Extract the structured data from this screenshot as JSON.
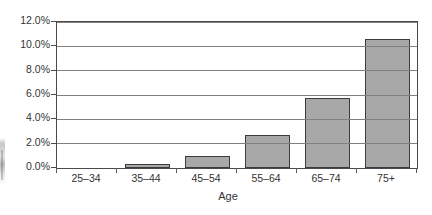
{
  "chart_data": {
    "type": "bar",
    "title": "",
    "xlabel": "Age",
    "ylabel": "",
    "categories": [
      "25–34",
      "35–44",
      "45–54",
      "55–64",
      "65–74",
      "75+"
    ],
    "values": [
      0.0,
      0.3,
      1.0,
      2.7,
      5.75,
      10.6
    ],
    "ylim": [
      0.0,
      12.0
    ],
    "ytick_values": [
      0.0,
      2.0,
      4.0,
      6.0,
      8.0,
      10.0,
      12.0
    ],
    "ytick_labels": [
      "0.0%",
      "2.0%",
      "4.0%",
      "6.0%",
      "8.0%",
      "10.0%",
      "12.0%"
    ],
    "grid": true,
    "legend": false,
    "series": [
      {
        "name": "",
        "values": [
          0.0,
          0.3,
          1.0,
          2.7,
          5.75,
          10.6
        ]
      }
    ],
    "colors": {
      "bar_fill": "#a8a8a8",
      "bar_border": "#3c3c3c",
      "gridline": "#808080",
      "plot_border": "#4a4a4a",
      "text": "#333333",
      "background": "#ffffff"
    }
  }
}
